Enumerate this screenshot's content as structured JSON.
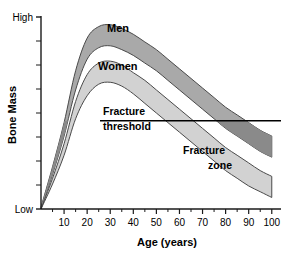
{
  "chart_data": {
    "type": "area",
    "title": "",
    "xlabel": "Age (years)",
    "ylabel": "Bone Mass",
    "xlim": [
      0,
      104
    ],
    "ylim": [
      0,
      100
    ],
    "grid": false,
    "legend_position": "inline-annotations",
    "x_ticks": [
      10,
      20,
      30,
      40,
      50,
      60,
      70,
      80,
      90,
      100
    ],
    "x_tick_labels": [
      "10",
      "20",
      "30",
      "40",
      "50",
      "60",
      "70",
      "80",
      "90",
      "100"
    ],
    "x_minor_ticks": [
      5,
      15,
      25,
      35,
      45,
      55,
      65,
      75,
      85,
      95
    ],
    "y_tick_count": 8,
    "y_axis_top_label": "High",
    "y_axis_bottom_label": "Low",
    "annotations": {
      "men_label": "Men",
      "women_label": "Women",
      "fracture_threshold_line1": "Fracture",
      "fracture_threshold_line2": "threshold",
      "fracture_zone_line1": "Fracture",
      "fracture_zone_line2": "zone",
      "fracture_threshold_value": 46
    },
    "colors": {
      "men_band": "#a9a9a9",
      "women_band": "#d2d2d2",
      "fracture_overlap": "#8a8a8a",
      "outline": "#4a4a4a",
      "axis": "#1a1a1a",
      "background": "#ffffff"
    },
    "series": [
      {
        "name": "Men",
        "role": "upper-band-top",
        "x": [
          0,
          5,
          10,
          15,
          20,
          25,
          30,
          35,
          40,
          45,
          50,
          55,
          60,
          65,
          70,
          75,
          80,
          85,
          90,
          95,
          100
        ],
        "values": [
          1,
          22,
          45,
          72,
          89,
          95,
          96,
          94,
          91,
          87,
          83,
          78,
          73,
          68,
          63,
          58,
          53,
          49,
          45,
          41,
          38
        ]
      },
      {
        "name": "Men",
        "role": "upper-band-bottom",
        "x": [
          0,
          5,
          10,
          15,
          20,
          25,
          30,
          35,
          40,
          45,
          50,
          55,
          60,
          65,
          70,
          75,
          80,
          85,
          90,
          95,
          100
        ],
        "values": [
          0,
          18,
          38,
          62,
          78,
          84,
          85,
          83,
          80,
          76,
          72,
          67,
          62,
          57,
          52,
          47,
          42,
          38,
          34,
          30,
          27
        ]
      },
      {
        "name": "Women",
        "role": "lower-band-top",
        "x": [
          0,
          5,
          10,
          15,
          20,
          25,
          30,
          35,
          40,
          45,
          50,
          55,
          60,
          65,
          70,
          75,
          80,
          85,
          90,
          95,
          100
        ],
        "values": [
          0,
          16,
          34,
          56,
          70,
          76,
          77,
          75,
          71,
          67,
          62,
          57,
          52,
          47,
          42,
          37,
          32,
          28,
          24,
          20,
          17
        ]
      },
      {
        "name": "Women",
        "role": "lower-band-bottom",
        "x": [
          0,
          5,
          10,
          15,
          20,
          25,
          30,
          35,
          40,
          45,
          50,
          55,
          60,
          65,
          70,
          75,
          80,
          85,
          90,
          95,
          100
        ],
        "values": [
          0,
          13,
          28,
          47,
          59,
          65,
          66,
          64,
          60,
          55,
          50,
          45,
          40,
          35,
          30,
          25,
          20,
          16,
          12,
          9,
          6
        ]
      }
    ]
  }
}
